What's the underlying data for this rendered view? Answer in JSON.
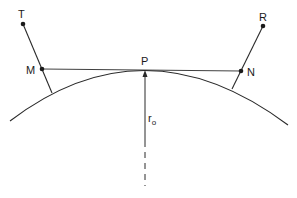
{
  "diagram": {
    "type": "geometry",
    "colors": {
      "stroke": "#2a2a2a",
      "background": "#ffffff"
    },
    "labels": {
      "T": "T",
      "R": "R",
      "M": "M",
      "N": "N",
      "P": "P",
      "radius_main": "r",
      "radius_sub": "o"
    },
    "points": {
      "T": [
        23,
        24
      ],
      "R": [
        263,
        26
      ],
      "M": [
        42,
        69
      ],
      "N": [
        241,
        71
      ],
      "P": [
        145,
        69
      ]
    }
  }
}
